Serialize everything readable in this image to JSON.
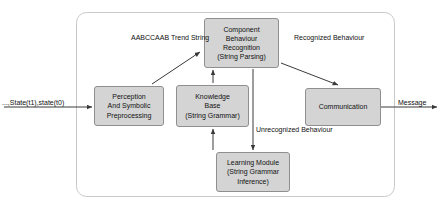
{
  "diagram": {
    "container_label": "system-boundary",
    "style": {
      "node_fill": "#d4d4d4",
      "node_stroke": "#8f8f8f",
      "edge_stroke": "#3a3a3a",
      "background": "#ffffff",
      "text_color": "#111111"
    },
    "nodes": [
      {
        "id": "perception",
        "name": "perception-and-symbolic-preprocessing",
        "lines": [
          "Perception",
          "And Symbolic",
          "Preprocessing"
        ]
      },
      {
        "id": "component_behaviour_recognition",
        "name": "component-behaviour-recognition",
        "lines": [
          "Component",
          "Behaviour",
          "Recognition",
          "(String Parsing)"
        ]
      },
      {
        "id": "knowledge_base",
        "name": "knowledge-base",
        "lines": [
          "Knowledge",
          "Base",
          "(String Grammar)"
        ]
      },
      {
        "id": "learning_module",
        "name": "learning-module",
        "lines": [
          "Learning Module",
          "(String Grammar",
          "Inference)"
        ]
      },
      {
        "id": "communication",
        "name": "communication",
        "lines": [
          "Communication"
        ]
      }
    ],
    "edge_labels": [
      {
        "id": "input_state",
        "name": "input-state-label",
        "lines": [
          "...,State(t1),state(t0)"
        ]
      },
      {
        "id": "trend_string",
        "name": "trend-string-label",
        "lines": [
          "AABCCAAB",
          "Trend",
          "String"
        ]
      },
      {
        "id": "recognized_behaviour",
        "name": "recognized-behaviour-label",
        "lines": [
          "Recognized",
          "Behaviour"
        ]
      },
      {
        "id": "unrecognized_behaviour",
        "name": "unrecognized-behaviour-label",
        "lines": [
          "Unrecognized",
          "Behaviour"
        ]
      },
      {
        "id": "message",
        "name": "message-label",
        "lines": [
          "Message"
        ]
      }
    ]
  }
}
